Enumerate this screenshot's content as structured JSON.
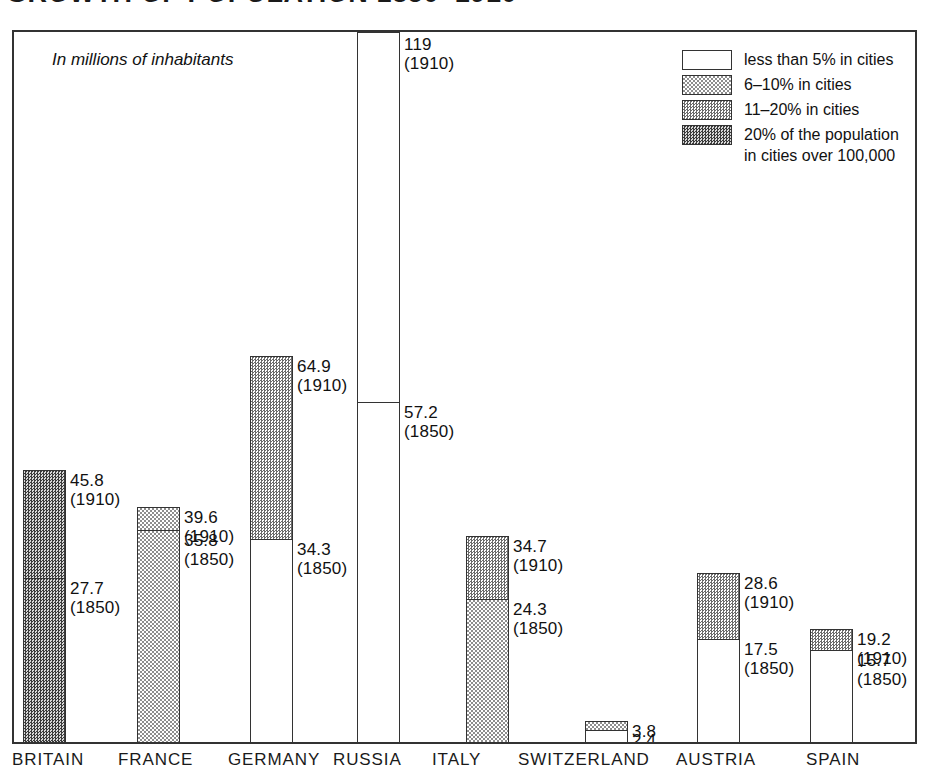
{
  "title": "GROWTH OF POPULATION 1850–1910",
  "subtitle": "In millions of inhabitants",
  "legend": {
    "items": [
      {
        "label": "less than 5% in cities",
        "label2": "",
        "pattern": "none"
      },
      {
        "label": "6–10% in cities",
        "label2": "",
        "pattern": "light"
      },
      {
        "label": "11–20% in cities",
        "label2": "",
        "pattern": "mid"
      },
      {
        "label": "20% of the population",
        "label2": "in cities over 100,000",
        "pattern": "dark"
      }
    ]
  },
  "axis": {
    "categories": [
      "BRITAIN",
      "FRANCE",
      "GERMANY",
      "RUSSIA",
      "ITALY",
      "SWITZERLAND",
      "AUSTRIA",
      "SPAIN"
    ]
  },
  "year_1850": "(1850)",
  "year_1910": "(1910)",
  "chart_data": {
    "type": "bar",
    "title": "GROWTH OF POPULATION 1850–1910",
    "subtitle": "In millions of inhabitants",
    "xlabel": "",
    "ylabel": "Millions of inhabitants",
    "ylim": [
      0,
      119
    ],
    "grid": false,
    "legend_position": "top-right",
    "note": "Stacked bars: lower segment = 1850 population, upper segment = growth to 1910. Fill pattern encodes share of population in cities over 100,000.",
    "categories": [
      "BRITAIN",
      "FRANCE",
      "GERMANY",
      "RUSSIA",
      "ITALY",
      "SWITZERLAND",
      "AUSTRIA",
      "SPAIN"
    ],
    "series": [
      {
        "name": "1850",
        "values": [
          27.7,
          35.8,
          34.3,
          57.2,
          24.3,
          2.4,
          17.5,
          15.7
        ]
      },
      {
        "name": "1910",
        "values": [
          45.8,
          39.6,
          64.9,
          119,
          34.7,
          3.8,
          28.6,
          19.2
        ]
      }
    ],
    "bars": [
      {
        "category": "BRITAIN",
        "v1850": "27.7",
        "v1910": "45.8",
        "pattern_1850": "dark",
        "pattern_1910": "dark",
        "clipped": false
      },
      {
        "category": "FRANCE",
        "v1850": "35.8",
        "v1910": "39.6",
        "pattern_1850": "light",
        "pattern_1910": "light",
        "clipped": false
      },
      {
        "category": "GERMANY",
        "v1850": "34.3",
        "v1910": "64.9",
        "pattern_1850": "none",
        "pattern_1910": "mid",
        "clipped": false
      },
      {
        "category": "RUSSIA",
        "v1850": "57.2",
        "v1910": "119",
        "pattern_1850": "none",
        "pattern_1910": "none",
        "clipped": true
      },
      {
        "category": "ITALY",
        "v1850": "24.3",
        "v1910": "34.7",
        "pattern_1850": "light",
        "pattern_1910": "mid",
        "clipped": false
      },
      {
        "category": "SWITZERLAND",
        "v1850": "2.4",
        "v1910": "3.8",
        "pattern_1850": "none",
        "pattern_1910": "light",
        "clipped": false
      },
      {
        "category": "AUSTRIA",
        "v1850": "17.5",
        "v1910": "28.6",
        "pattern_1850": "none",
        "pattern_1910": "mid",
        "clipped": false
      },
      {
        "category": "SPAIN",
        "v1850": "15.7",
        "v1910": "19.2",
        "pattern_1850": "none",
        "pattern_1910": "mid",
        "clipped": false
      }
    ]
  },
  "layout": {
    "bar_x": [
      9,
      123,
      236,
      343,
      452,
      571,
      683,
      796
    ],
    "bar_w": 43,
    "label_dx": 47,
    "xlabel_x": [
      12,
      118,
      228,
      333,
      432,
      518,
      676,
      806
    ],
    "px_per_unit": 5.98,
    "baseline_y": 712
  }
}
